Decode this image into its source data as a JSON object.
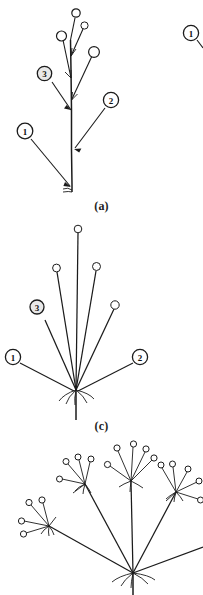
{
  "sheet": {
    "background_color": "#ffffff",
    "ink_color": "#1b1b1b",
    "kind": "botanical-line-drawing"
  },
  "panels": [
    {
      "id": "raceme",
      "caption": "(a)",
      "type": "raceme",
      "description": "Elongated central axis bearing stalked flowers along its length",
      "flower_count": 4,
      "callouts": [
        {
          "label": "1",
          "target": "main stem base",
          "shaded": false
        },
        {
          "label": "2",
          "target": "pedicel",
          "shaded": false
        },
        {
          "label": "3",
          "target": "upper axis node",
          "shaded": true
        }
      ]
    },
    {
      "id": "umbel",
      "caption": "(c)",
      "type": "simple-umbel",
      "description": "Rays of equal length radiating from a single common point",
      "flower_count": 5,
      "ray_count": 5,
      "callouts": [
        {
          "label": "1",
          "target": "peduncle",
          "shaded": false
        },
        {
          "label": "2",
          "target": "umbel node",
          "shaded": false
        },
        {
          "label": "3",
          "target": "ray",
          "shaded": true
        }
      ]
    },
    {
      "id": "compound-umbel",
      "caption": "",
      "type": "compound-umbel",
      "description": "Primary rays each terminating in a secondary umbellet",
      "primary_ray_count": 5,
      "flowers_per_umbellet": 5,
      "callouts": []
    }
  ],
  "edge_callouts": [
    {
      "label": "1",
      "position": "top-right",
      "note": "partially cropped marker belonging to adjacent figure"
    }
  ]
}
